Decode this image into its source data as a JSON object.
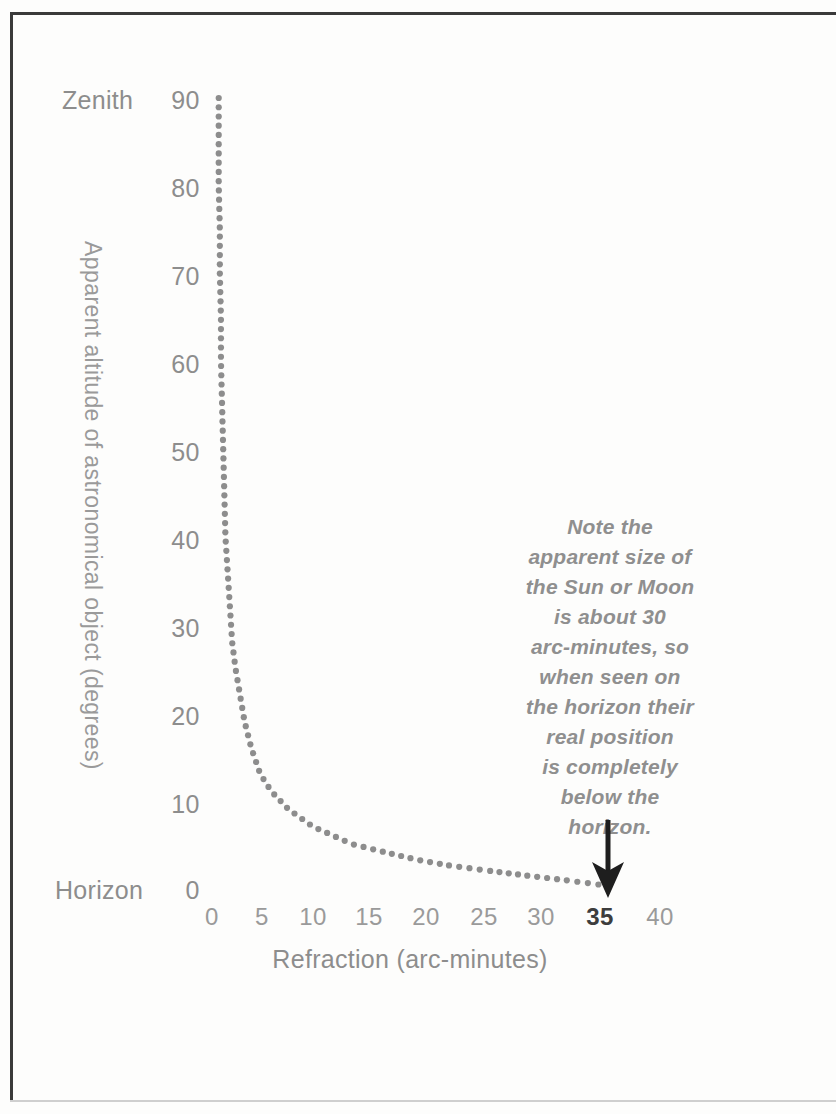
{
  "chart_data": {
    "type": "line",
    "title": "",
    "subtitle": "",
    "xlabel": "Refraction (arc-minutes)",
    "ylabel": "Apparent altitude of astronomical object (degrees)",
    "xlim": [
      0,
      40
    ],
    "ylim": [
      0,
      90
    ],
    "grid": false,
    "legend": null,
    "marker_style": "dotted",
    "ink_color": "#8d8d8d",
    "x_ticks": [
      "0",
      "5",
      "10",
      "15",
      "20",
      "25",
      "30",
      "35",
      "40"
    ],
    "x_tick_values": [
      0,
      5,
      10,
      15,
      20,
      25,
      30,
      35,
      40
    ],
    "x_tick_emphasized": "35",
    "y_ticks": [
      "0",
      "10",
      "20",
      "30",
      "40",
      "50",
      "60",
      "70",
      "80",
      "90"
    ],
    "y_tick_values": [
      0,
      10,
      20,
      30,
      40,
      50,
      60,
      70,
      80,
      90
    ],
    "axis_end_labels": {
      "y_top": "Zenith",
      "y_bottom": "Horizon"
    },
    "series": [
      {
        "name": "Atmospheric refraction",
        "x": [
          0.6,
          0.6,
          0.6,
          0.7,
          0.7,
          0.8,
          0.8,
          0.9,
          1.0,
          1.1,
          1.2,
          1.4,
          1.6,
          1.8,
          2.1,
          2.5,
          2.9,
          3.5,
          4.3,
          5.3,
          6.8,
          9.0,
          12.5,
          15.7,
          18.4,
          21.0,
          24.5,
          28.2,
          31.5,
          34.5
        ],
        "y": [
          90,
          85,
          80,
          75,
          70,
          65,
          60,
          55,
          50,
          45,
          40,
          36,
          32,
          28,
          25,
          22,
          19,
          16,
          13,
          11,
          9,
          7,
          5,
          4,
          3.2,
          2.6,
          2.0,
          1.4,
          0.9,
          0.4
        ]
      }
    ],
    "annotations": [
      {
        "name": "sun-moon-note",
        "text": "Note the apparent size of the Sun or Moon is about 30 arc-minutes, so when seen on the horizon their real position is completely below the horizon.",
        "lines": [
          "Note the",
          "apparent size of",
          "the Sun or Moon",
          "is about 30",
          "arc-minutes, so",
          "when seen on",
          "the horizon their",
          "real position",
          "is completely",
          "below the",
          "horizon."
        ],
        "style": "italic",
        "arrow": {
          "direction": "down",
          "points_to_x": 35,
          "points_to_y": 0,
          "color": "#1e1e1e"
        }
      }
    ]
  }
}
